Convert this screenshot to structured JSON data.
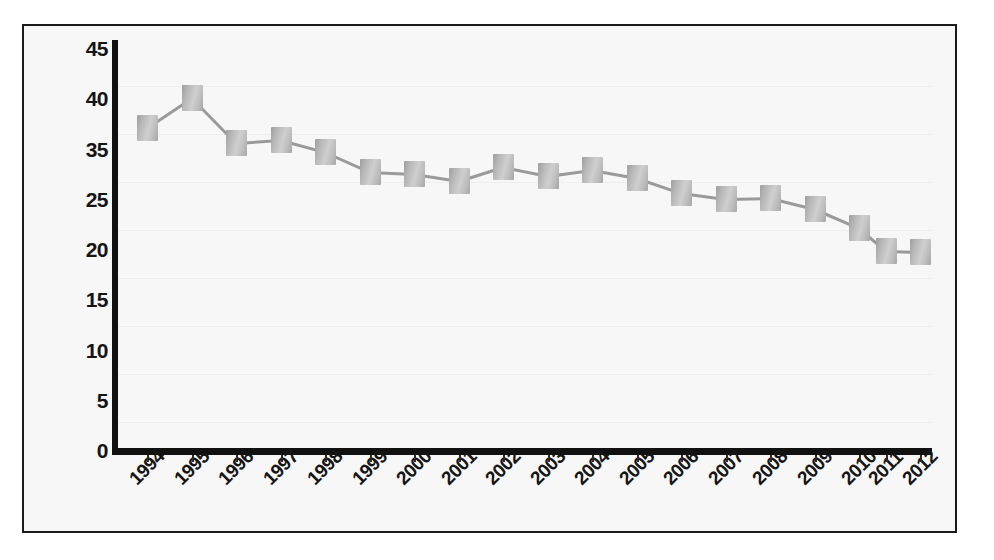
{
  "chart_data": {
    "type": "line",
    "title": "",
    "subtitle": "",
    "xlabel": "",
    "ylabel": "",
    "grid": false,
    "legend": false,
    "legend_position": "none",
    "marker_style": "gray-3d-square",
    "line_color": "#9a9a9a",
    "marker_color": "#c0c0c0",
    "axis_color": "#111111",
    "background_color": "#f7f7f7",
    "border_color": "#1a1a1a",
    "ytick_labels": [
      "45",
      "40",
      "35",
      "25",
      "20",
      "15",
      "10",
      "5",
      "0"
    ],
    "ylim": [
      0,
      45
    ],
    "categories": [
      "1994",
      "1995",
      "1996",
      "1997",
      "1998",
      "1999",
      "2000",
      "2001",
      "2002",
      "2003",
      "2004",
      "2005",
      "2006",
      "2007",
      "2008",
      "2009",
      "2010",
      "2011",
      "2012"
    ],
    "values": [
      38,
      41,
      37,
      37,
      36,
      34,
      34,
      33,
      34.5,
      33.5,
      34,
      33,
      32,
      31.5,
      31.5,
      30,
      28.5,
      27.5,
      27.5
    ],
    "series": [
      {
        "name": "series-1",
        "values": [
          38,
          41,
          37,
          37,
          36,
          34,
          34,
          33,
          34.5,
          33.5,
          34,
          33,
          32,
          31.5,
          31.5,
          30,
          28.5,
          27.5,
          27.5
        ]
      }
    ],
    "point_pixels": [
      {
        "x": 123,
        "y": 102
      },
      {
        "x": 168,
        "y": 72
      },
      {
        "x": 212,
        "y": 117
      },
      {
        "x": 257,
        "y": 114
      },
      {
        "x": 301,
        "y": 126
      },
      {
        "x": 346,
        "y": 146
      },
      {
        "x": 390,
        "y": 148
      },
      {
        "x": 435,
        "y": 155
      },
      {
        "x": 479,
        "y": 141
      },
      {
        "x": 524,
        "y": 150
      },
      {
        "x": 568,
        "y": 144
      },
      {
        "x": 613,
        "y": 152
      },
      {
        "x": 657,
        "y": 167
      },
      {
        "x": 702,
        "y": 173
      },
      {
        "x": 746,
        "y": 172
      },
      {
        "x": 791,
        "y": 183
      },
      {
        "x": 835,
        "y": 202
      },
      {
        "x": 862,
        "y": 225
      },
      {
        "x": 896,
        "y": 226
      }
    ]
  }
}
